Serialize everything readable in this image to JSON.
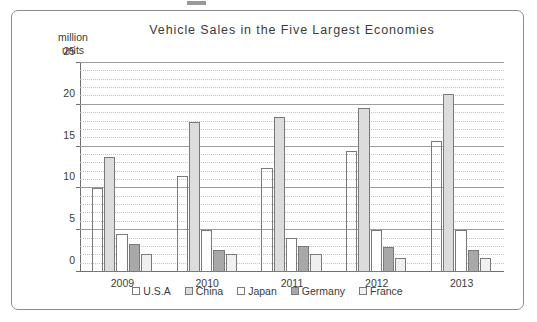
{
  "figure": {
    "title": "Vehicle Sales in the Five Largest Economies",
    "y_unit_label": "million\nunits"
  },
  "chart_data": {
    "type": "bar",
    "title": "Vehicle Sales in the Five Largest Economies",
    "xlabel": "",
    "ylabel": "million units",
    "ylim": [
      0,
      25
    ],
    "y_ticks": [
      0,
      5,
      10,
      15,
      20,
      25
    ],
    "y_minor_ticks": [
      1,
      2,
      3,
      4,
      6,
      7,
      8,
      9,
      11,
      12,
      13,
      14,
      16,
      17,
      18,
      19,
      21,
      22,
      23,
      24
    ],
    "grid": true,
    "legend_position": "bottom",
    "categories": [
      "2009",
      "2010",
      "2011",
      "2012",
      "2013"
    ],
    "series": [
      {
        "name": "U.S.A",
        "values": [
          10.0,
          11.5,
          12.4,
          14.5,
          15.7
        ],
        "fill": "hatched",
        "color": "#e4e4e4"
      },
      {
        "name": "China",
        "values": [
          13.8,
          18.0,
          18.6,
          19.6,
          21.3
        ],
        "fill": "solid",
        "color": "#dcdcdc"
      },
      {
        "name": "Japan",
        "values": [
          4.6,
          5.0,
          4.1,
          5.0,
          5.0
        ],
        "fill": "solid",
        "color": "#ffffff"
      },
      {
        "name": "Germany",
        "values": [
          3.4,
          2.6,
          3.1,
          3.0,
          2.6
        ],
        "fill": "solid",
        "color": "#a8a8a8"
      },
      {
        "name": "France",
        "values": [
          2.1,
          2.2,
          2.2,
          1.7,
          1.7
        ],
        "fill": "solid",
        "color": "#f0f0f0"
      }
    ]
  },
  "colors": {
    "frame": "#8d8d8d",
    "axis": "#6f6f6f",
    "gridline_major": "#9d9d9d",
    "gridline_minor": "#c9c2c2",
    "text": "#3b3b3b",
    "bar_outline": "#7a7a7a"
  }
}
